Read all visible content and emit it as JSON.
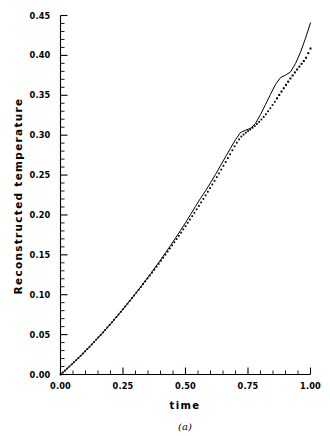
{
  "figure": {
    "caption": "(a)",
    "xlabel": "time",
    "ylabel": "Reconstructed temperature"
  },
  "axes": {
    "x_tick_labels": [
      "0.00",
      "0.25",
      "0.50",
      "0.75",
      "1.00"
    ],
    "y_tick_labels": [
      "0.00",
      "0.05",
      "0.10",
      "0.15",
      "0.20",
      "0.25",
      "0.30",
      "0.35",
      "0.40",
      "0.45"
    ],
    "x_tick_values": [
      0.0,
      0.25,
      0.5,
      0.75,
      1.0
    ],
    "y_tick_values": [
      0.0,
      0.05,
      0.1,
      0.15,
      0.2,
      0.25,
      0.3,
      0.35,
      0.4,
      0.45
    ],
    "x_minor_step": 0.05,
    "y_minor_step": 0.01,
    "line_color": "#000000"
  },
  "chart_data": {
    "type": "line",
    "title": "",
    "subtitle": "",
    "xlabel": "time",
    "ylabel": "Reconstructed temperature",
    "caption": "(a)",
    "xlim": [
      0.0,
      1.0
    ],
    "ylim": [
      0.0,
      0.45
    ],
    "xticks": [
      0.0,
      0.25,
      0.5,
      0.75,
      1.0
    ],
    "yticks": [
      0.0,
      0.05,
      0.1,
      0.15,
      0.2,
      0.25,
      0.3,
      0.35,
      0.4,
      0.45
    ],
    "grid": false,
    "legend": "none",
    "x": [
      0.0,
      0.02,
      0.04,
      0.06,
      0.08,
      0.1,
      0.12,
      0.14,
      0.16,
      0.18,
      0.2,
      0.22,
      0.24,
      0.26,
      0.28,
      0.3,
      0.32,
      0.34,
      0.36,
      0.38,
      0.4,
      0.42,
      0.44,
      0.46,
      0.48,
      0.5,
      0.52,
      0.54,
      0.56,
      0.58,
      0.6,
      0.62,
      0.64,
      0.66,
      0.68,
      0.7,
      0.72,
      0.74,
      0.76,
      0.78,
      0.8,
      0.82,
      0.84,
      0.86,
      0.88,
      0.9,
      0.92,
      0.94,
      0.96,
      0.98,
      1.0
    ],
    "series": [
      {
        "name": "exact temperature",
        "style": "solid-line",
        "color": "#000000",
        "values": [
          0.0,
          0.0055,
          0.0113,
          0.0172,
          0.0233,
          0.0296,
          0.036,
          0.0426,
          0.0494,
          0.0563,
          0.0634,
          0.0707,
          0.0781,
          0.0857,
          0.0935,
          0.1014,
          0.1095,
          0.1178,
          0.1262,
          0.1348,
          0.1436,
          0.1526,
          0.1617,
          0.171,
          0.1805,
          0.1903,
          0.2005,
          0.2108,
          0.2208,
          0.2303,
          0.2402,
          0.2508,
          0.2618,
          0.2728,
          0.2836,
          0.2944,
          0.3033,
          0.3062,
          0.3085,
          0.3148,
          0.3258,
          0.3384,
          0.3512,
          0.3636,
          0.3722,
          0.3752,
          0.3792,
          0.3898,
          0.4039,
          0.4215,
          0.4408
        ]
      },
      {
        "name": "reconstructed temperature",
        "style": "dotted-markers",
        "color": "#000000",
        "values": [
          0.0,
          0.0055,
          0.0113,
          0.0172,
          0.0233,
          0.0296,
          0.036,
          0.0426,
          0.0494,
          0.0563,
          0.0634,
          0.0707,
          0.0781,
          0.0857,
          0.0934,
          0.1012,
          0.1091,
          0.1171,
          0.1252,
          0.1334,
          0.1418,
          0.1503,
          0.159,
          0.1678,
          0.1768,
          0.186,
          0.1953,
          0.2048,
          0.2145,
          0.2244,
          0.2345,
          0.2448,
          0.2553,
          0.266,
          0.2769,
          0.288,
          0.2974,
          0.3029,
          0.3073,
          0.3122,
          0.3183,
          0.3256,
          0.334,
          0.3432,
          0.3528,
          0.3622,
          0.3712,
          0.3797,
          0.3878,
          0.3956,
          0.4086
        ]
      }
    ]
  }
}
